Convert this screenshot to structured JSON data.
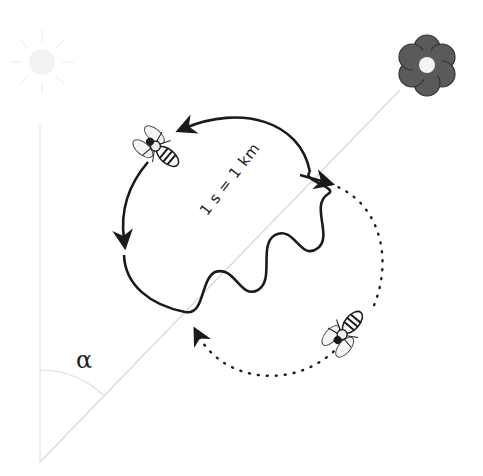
{
  "diagram": {
    "type": "waggle-dance",
    "labels": {
      "waggle_scale": "1 s = 1 km",
      "angle": "α"
    },
    "icons": [
      "sun-icon",
      "flower-icon",
      "bee-icon",
      "bee-icon"
    ],
    "colors": {
      "stroke": "#1a1a1a",
      "guide_line": "#d8d8d8",
      "flower_petals": "#555555",
      "flower_center": "#f4f4f4"
    }
  }
}
